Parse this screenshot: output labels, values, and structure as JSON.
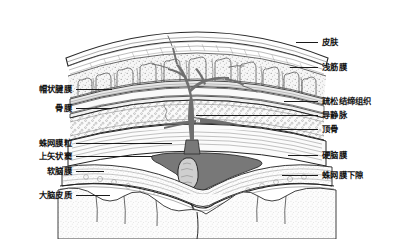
{
  "figure": {
    "background_color": "#ffffff",
    "ink_color": "#1a1a1a",
    "vein_color": "#6f6f6f",
    "sinus_color": "#787878",
    "tissue_fill": "#f2f2f2",
    "cortex_fill": "#fbfbfb"
  },
  "labels": {
    "left": [
      {
        "text": "帽状腱膜",
        "text_x": 72,
        "text_y": 89,
        "line_x1": 76,
        "line_x2": 112,
        "line_y": 89
      },
      {
        "text": "骨膜",
        "text_x": 72,
        "text_y": 108,
        "line_x1": 76,
        "line_x2": 112,
        "line_y": 108
      },
      {
        "text": "蛛网膜粒",
        "text_x": 72,
        "text_y": 143,
        "line_x1": 76,
        "line_x2": 172,
        "line_y": 143
      },
      {
        "text": "上矢状窦",
        "text_x": 72,
        "text_y": 156,
        "line_x1": 76,
        "line_x2": 152,
        "line_y": 156
      },
      {
        "text": "软脑膜",
        "text_x": 72,
        "text_y": 171,
        "line_x1": 76,
        "line_x2": 104,
        "line_y": 171
      },
      {
        "text": "大脑皮质",
        "text_x": 72,
        "text_y": 195,
        "line_x1": 76,
        "line_x2": 110,
        "line_y": 195
      }
    ],
    "right": [
      {
        "text": "皮肤",
        "text_x": 322,
        "text_y": 42,
        "line_x1": 296,
        "line_x2": 318,
        "line_y": 42
      },
      {
        "text": "浅筋膜",
        "text_x": 322,
        "text_y": 67,
        "line_x1": 290,
        "line_x2": 318,
        "line_y": 67
      },
      {
        "text": "疏松结缔组织",
        "text_x": 322,
        "text_y": 101,
        "line_x1": 284,
        "line_x2": 318,
        "line_y": 101
      },
      {
        "text": "导静脉",
        "text_x": 322,
        "text_y": 115,
        "line_x1": 196,
        "line_x2": 318,
        "line_y": 115
      },
      {
        "text": "顶骨",
        "text_x": 322,
        "text_y": 129,
        "line_x1": 272,
        "line_x2": 318,
        "line_y": 129
      },
      {
        "text": "硬脑膜",
        "text_x": 322,
        "text_y": 155,
        "line_x1": 288,
        "line_x2": 318,
        "line_y": 155
      },
      {
        "text": "蛛网膜下隙",
        "text_x": 322,
        "text_y": 175,
        "line_x1": 282,
        "line_x2": 318,
        "line_y": 175
      }
    ]
  }
}
